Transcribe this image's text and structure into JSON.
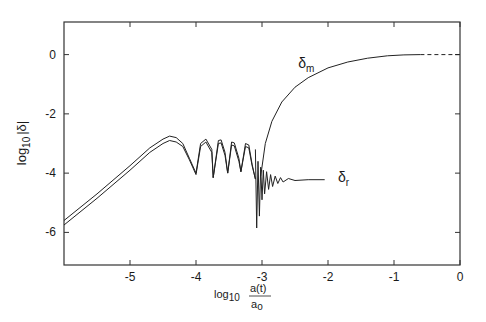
{
  "chart_data": {
    "type": "line",
    "title": "",
    "xlabel": "log10 a(t)/a0",
    "xlabel_parts": {
      "prefix": "log",
      "sub": "10",
      "num": "a(t)",
      "den": "a",
      "den_sub": "o"
    },
    "ylabel": "log10 |δ|",
    "ylabel_parts": {
      "prefix": "log",
      "sub": "10",
      "body": "|δ|"
    },
    "xlim": [
      -6.0,
      0.0
    ],
    "ylim": [
      -7.1,
      1.1
    ],
    "x_ticks": [
      -5,
      -4,
      -3,
      -2,
      -1,
      0
    ],
    "x_tick_labels": [
      "-5",
      "-4",
      "-3",
      "-2",
      "-1",
      "0"
    ],
    "y_ticks": [
      0,
      -2,
      -4,
      -6
    ],
    "y_tick_labels": [
      "0",
      "-2",
      "-4",
      "-6"
    ],
    "grid": false,
    "legend": null,
    "annotations": [
      {
        "text": "δ",
        "sub": "m",
        "x": -2.45,
        "y": -0.45,
        "series": "delta_m"
      },
      {
        "text": "δ",
        "sub": "r",
        "x": -1.85,
        "y": -4.3,
        "series": "delta_r"
      }
    ],
    "series": [
      {
        "name": "δ (upper branch, pre-recombination)",
        "style": "solid",
        "x": [
          -6.0,
          -5.5,
          -5.0,
          -4.7,
          -4.5,
          -4.4,
          -4.3,
          -4.2,
          -4.1,
          -4.0,
          -3.93,
          -3.85,
          -3.76,
          -3.74,
          -3.66,
          -3.62,
          -3.56,
          -3.52,
          -3.46,
          -3.42,
          -3.35,
          -3.32,
          -3.25,
          -3.2,
          -3.15,
          -3.1
        ],
        "y": [
          -5.6,
          -4.7,
          -3.75,
          -3.15,
          -2.85,
          -2.75,
          -2.8,
          -3.0,
          -3.5,
          -4.0,
          -3.0,
          -2.85,
          -3.2,
          -4.15,
          -2.9,
          -2.88,
          -3.3,
          -4.0,
          -2.95,
          -2.98,
          -3.5,
          -3.95,
          -3.0,
          -3.05,
          -3.7,
          -4.2
        ]
      },
      {
        "name": "δ (lower branch, pre-recombination)",
        "style": "solid",
        "x": [
          -6.0,
          -5.5,
          -5.0,
          -4.7,
          -4.5,
          -4.4,
          -4.3,
          -4.2,
          -4.1,
          -4.0,
          -3.93,
          -3.85,
          -3.76,
          -3.74,
          -3.66,
          -3.62,
          -3.56,
          -3.52,
          -3.46,
          -3.42,
          -3.35,
          -3.32,
          -3.25,
          -3.2,
          -3.15,
          -3.1
        ],
        "y": [
          -5.75,
          -4.85,
          -3.9,
          -3.3,
          -3.0,
          -2.9,
          -2.95,
          -3.1,
          -3.55,
          -4.05,
          -3.1,
          -2.95,
          -3.3,
          -4.15,
          -3.0,
          -2.98,
          -3.4,
          -4.0,
          -3.05,
          -3.08,
          -3.6,
          -3.95,
          -3.1,
          -3.15,
          -3.75,
          -4.2
        ]
      },
      {
        "name": "delta_m",
        "label": "δm",
        "style": "solid",
        "x": [
          -3.02,
          -2.95,
          -2.85,
          -2.7,
          -2.5,
          -2.3,
          -2.0,
          -1.7,
          -1.4,
          -1.1,
          -0.85,
          -0.6
        ],
        "y": [
          -4.1,
          -3.0,
          -2.25,
          -1.6,
          -1.1,
          -0.78,
          -0.45,
          -0.25,
          -0.12,
          -0.04,
          -0.01,
          0.0
        ]
      },
      {
        "name": "delta_m_extrapolated",
        "style": "dashed",
        "x": [
          -0.6,
          0.0
        ],
        "y": [
          0.0,
          0.0
        ]
      },
      {
        "name": "delta_r",
        "label": "δr",
        "style": "solid",
        "x": [
          -3.1,
          -3.08,
          -3.06,
          -3.04,
          -3.02,
          -3.0,
          -2.98,
          -2.96,
          -2.93,
          -2.9,
          -2.87,
          -2.84,
          -2.8,
          -2.76,
          -2.72,
          -2.68,
          -2.6,
          -2.5,
          -2.3,
          -2.05
        ],
        "y": [
          -3.2,
          -5.85,
          -3.6,
          -5.45,
          -3.8,
          -4.9,
          -3.9,
          -4.7,
          -3.95,
          -4.55,
          -4.05,
          -4.45,
          -4.1,
          -4.35,
          -4.15,
          -4.3,
          -4.18,
          -4.25,
          -4.22,
          -4.22
        ]
      }
    ]
  }
}
